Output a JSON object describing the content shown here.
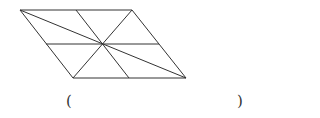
{
  "figure": {
    "shape": "parallelogram",
    "stroke_color": "#333333",
    "vertices": {
      "top_left": [
        20,
        10
      ],
      "top_right": [
        132,
        10
      ],
      "bottom_right": [
        186,
        78
      ],
      "bottom_left": [
        73,
        78
      ]
    },
    "center": [
      103,
      44
    ],
    "segments": [
      {
        "name": "top-edge",
        "from": [
          20,
          10
        ],
        "to": [
          132,
          10
        ]
      },
      {
        "name": "right-edge",
        "from": [
          132,
          10
        ],
        "to": [
          186,
          78
        ]
      },
      {
        "name": "bottom-edge",
        "from": [
          186,
          78
        ],
        "to": [
          73,
          78
        ]
      },
      {
        "name": "left-edge",
        "from": [
          73,
          78
        ],
        "to": [
          20,
          10
        ]
      },
      {
        "name": "diagonal-long",
        "from": [
          20,
          10
        ],
        "to": [
          186,
          78
        ]
      },
      {
        "name": "diagonal-short",
        "from": [
          132,
          10
        ],
        "to": [
          73,
          78
        ]
      },
      {
        "name": "midline-horizontal",
        "from": [
          46,
          44
        ],
        "to": [
          159,
          44
        ]
      },
      {
        "name": "midline-slanted",
        "from": [
          76,
          10
        ],
        "to": [
          129,
          78
        ]
      }
    ]
  },
  "answer": {
    "open_paren": "(",
    "close_paren": ")",
    "value": ""
  }
}
